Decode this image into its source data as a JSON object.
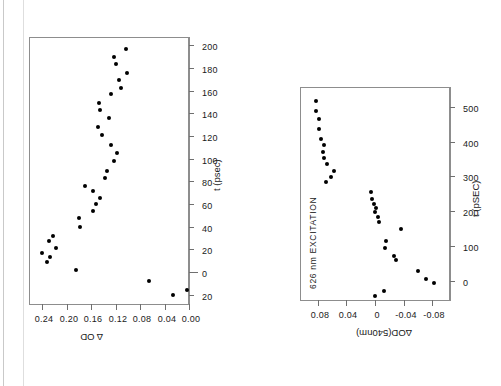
{
  "figure": {
    "orientation": "rotated-90-ccw",
    "background": "#ffffff",
    "ink_color": "#000000",
    "frame_color": "#8d8d8d"
  },
  "chart_data": [
    {
      "id": "top-panel",
      "type": "scatter",
      "title": "",
      "xlabel": "t (psec)",
      "ylabel": "Δ OD",
      "xlim": [
        -28,
        208
      ],
      "ylim": [
        0.0,
        0.262
      ],
      "xticks": [
        -20,
        0,
        20,
        40,
        60,
        80,
        100,
        120,
        140,
        160,
        180,
        200
      ],
      "xticklabels": [
        "20",
        "0",
        "20",
        "40",
        "60",
        "80",
        "100",
        "120",
        "140",
        "160",
        "180",
        "200"
      ],
      "yticks": [
        0.0,
        0.04,
        0.08,
        0.12,
        0.16,
        0.2,
        0.24
      ],
      "yticklabels": [
        "0.00",
        "0.04",
        "0.08",
        "0.12",
        "0.16",
        "0.20",
        "0.24"
      ],
      "grid": false,
      "legend": "none",
      "x": [
        -15,
        -19,
        -7,
        3,
        10,
        14,
        18,
        22,
        28,
        33,
        41,
        49,
        55,
        61,
        66,
        72,
        77,
        84,
        90,
        99,
        106,
        113,
        122,
        129,
        137,
        144,
        150,
        158,
        163,
        170,
        176,
        184,
        190,
        197
      ],
      "y": [
        0.003,
        0.026,
        0.065,
        0.185,
        0.233,
        0.227,
        0.24,
        0.218,
        0.229,
        0.222,
        0.178,
        0.18,
        0.158,
        0.152,
        0.146,
        0.157,
        0.17,
        0.137,
        0.135,
        0.123,
        0.118,
        0.128,
        0.142,
        0.149,
        0.131,
        0.145,
        0.148,
        0.127,
        0.111,
        0.114,
        0.102,
        0.12,
        0.122,
        0.103
      ]
    },
    {
      "id": "bottom-panel",
      "type": "scatter",
      "title": "",
      "xlabel": "t (pSEC)",
      "ylabel": "ΔOD(540nm)",
      "annotation": "626 nm EXCITATION",
      "xlim": [
        -55,
        560
      ],
      "ylim": [
        -0.105,
        0.105
      ],
      "xticks": [
        0,
        100,
        200,
        300,
        400,
        500
      ],
      "xticklabels": [
        "0",
        "100",
        "200",
        "300",
        "400",
        "500"
      ],
      "yticks": [
        -0.08,
        -0.04,
        0,
        0.04,
        0.08
      ],
      "yticklabels": [
        "-0.08",
        "-0.04",
        "0",
        "0.04",
        "0.08"
      ],
      "grid": false,
      "legend": "none",
      "x": [
        -2,
        -40,
        -26,
        8,
        30,
        62,
        74,
        96,
        118,
        152,
        172,
        186,
        200,
        212,
        224,
        238,
        258,
        288,
        302,
        320,
        340,
        356,
        372,
        392,
        410,
        440,
        468,
        492,
        520
      ],
      "y": [
        -0.082,
        0.0,
        -0.012,
        -0.072,
        -0.06,
        -0.03,
        -0.026,
        -0.014,
        -0.016,
        -0.036,
        -0.006,
        -0.004,
        0.0,
        -0.002,
        0.002,
        0.004,
        0.006,
        0.068,
        0.062,
        0.058,
        0.067,
        0.072,
        0.073,
        0.071,
        0.076,
        0.079,
        0.078,
        0.082,
        0.083
      ]
    }
  ]
}
